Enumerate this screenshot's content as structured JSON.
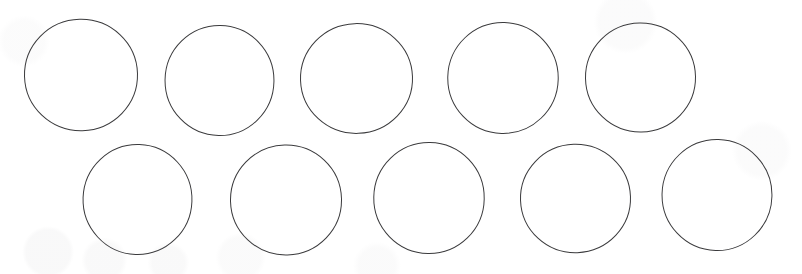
{
  "document": {
    "kind": "scanned-worksheet",
    "title": "Ten Circles Worksheet",
    "background_color": "#ffffff",
    "width": 802,
    "height": 274
  },
  "drawing": {
    "shape_type": "circle",
    "shape_count": 10,
    "row_count": 2,
    "columns_per_row": 5,
    "stroke_color": "#3a3a3c",
    "stroke_width": 1.6,
    "fill_color": "none",
    "rows": [
      {
        "row_label": "top-row",
        "shape_count": 5
      },
      {
        "row_label": "bottom-row",
        "shape_count": 5
      }
    ],
    "shapes": [
      {
        "id": "circle-1",
        "row": "top-row",
        "index_in_row": 1,
        "cx": 81,
        "cy": 75,
        "d": 114,
        "rot": -1.5,
        "sx": 1.0,
        "sy": 0.985
      },
      {
        "id": "circle-2",
        "row": "top-row",
        "index_in_row": 2,
        "cx": 219,
        "cy": 80,
        "d": 111,
        "rot": 1.0,
        "sx": 0.99,
        "sy": 1.0
      },
      {
        "id": "circle-3",
        "row": "top-row",
        "index_in_row": 3,
        "cx": 356,
        "cy": 78,
        "d": 113,
        "rot": -2.0,
        "sx": 1.0,
        "sy": 0.98
      },
      {
        "id": "circle-4",
        "row": "top-row",
        "index_in_row": 4,
        "cx": 503,
        "cy": 78,
        "d": 112,
        "rot": 1.5,
        "sx": 0.995,
        "sy": 1.0
      },
      {
        "id": "circle-5",
        "row": "top-row",
        "index_in_row": 5,
        "cx": 640,
        "cy": 77,
        "d": 111,
        "rot": -1.0,
        "sx": 1.0,
        "sy": 0.99
      },
      {
        "id": "circle-6",
        "row": "bottom-row",
        "index_in_row": 1,
        "cx": 137,
        "cy": 199,
        "d": 111,
        "rot": 2.0,
        "sx": 0.99,
        "sy": 1.0
      },
      {
        "id": "circle-7",
        "row": "bottom-row",
        "index_in_row": 2,
        "cx": 286,
        "cy": 200,
        "d": 112,
        "rot": -1.5,
        "sx": 1.0,
        "sy": 0.99
      },
      {
        "id": "circle-8",
        "row": "bottom-row",
        "index_in_row": 3,
        "cx": 429,
        "cy": 198,
        "d": 112,
        "rot": 1.0,
        "sx": 0.995,
        "sy": 1.0
      },
      {
        "id": "circle-9",
        "row": "bottom-row",
        "index_in_row": 4,
        "cx": 575,
        "cy": 198,
        "d": 111,
        "rot": -2.0,
        "sx": 1.0,
        "sy": 0.985
      },
      {
        "id": "circle-10",
        "row": "bottom-row",
        "index_in_row": 5,
        "cx": 717,
        "cy": 195,
        "d": 112,
        "rot": 1.5,
        "sx": 0.99,
        "sy": 1.0
      }
    ]
  }
}
